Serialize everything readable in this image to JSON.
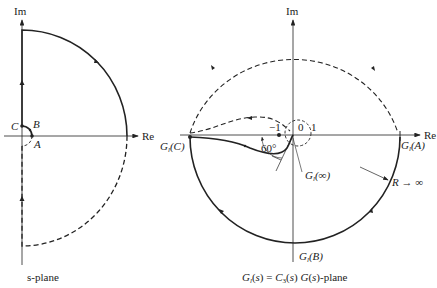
{
  "left_plot": {
    "axis_im_label": "Im",
    "axis_re_label": "Re",
    "points": {
      "A": "A",
      "B": "B",
      "C": "C"
    },
    "caption": "s-plane"
  },
  "right_plot": {
    "axis_im_label": "Im",
    "axis_re_label": "Re",
    "tick_minus_one": "−1",
    "tick_zero": "0",
    "tick_one": "1",
    "angle_label": "60°",
    "label_GC": "G_l(C)",
    "label_GA": "G_l(A)",
    "label_GB": "G_l(B)",
    "label_Ginf": "G_l(∞)",
    "label_R": "R → ∞",
    "caption": "G_l(s) = C_3(s) G(s)-plane"
  },
  "colors": {
    "line": "#222222",
    "background": "#ffffff"
  }
}
